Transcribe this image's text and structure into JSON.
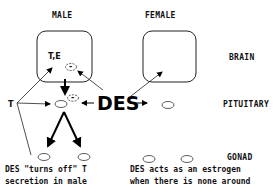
{
  "columns": {
    "male": "MALE",
    "female": "FEMALE"
  },
  "levels": {
    "brain": "BRAIN",
    "pituitary": "PITUITARY",
    "gonad": "GONAD"
  },
  "male_brain_label": "T,E",
  "inhibit_symbol": "(-)",
  "hormone_left": "T",
  "agent": "DES",
  "notes": {
    "male_line1": "DES \"turns off\"  T",
    "male_line2": "secretion in male",
    "female_line1": "DES acts as an estrogen",
    "female_line2": "when there is none around"
  }
}
